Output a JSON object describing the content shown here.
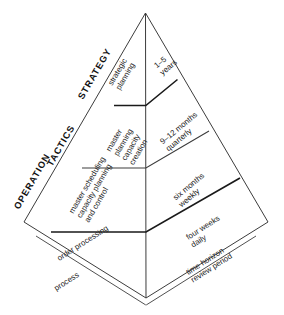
{
  "diagram": {
    "line_color": "#3c3c3c",
    "bold_line_color": "#1a1a1a",
    "background": "#ffffff",
    "edge_labels": [
      {
        "key": "operation",
        "text": "OPERATION"
      },
      {
        "key": "tactics",
        "text": "TACTICS"
      },
      {
        "key": "strategy",
        "text": "STRATEGY"
      }
    ],
    "axis_labels": [
      {
        "key": "process",
        "text": "process"
      },
      {
        "key": "time-horizon",
        "text": "time horizon\nreview period"
      }
    ],
    "tiers": [
      {
        "key": "tier-strategic",
        "level": "STRATEGY",
        "process": "strategic\nplanning",
        "horizon": "1–5\nyears"
      },
      {
        "key": "tier-master-planning",
        "level": "TACTICS",
        "process": "master\nplanning\ncapacity\ncreation",
        "horizon": "9–12 months\nquarterly"
      },
      {
        "key": "tier-master-scheduling",
        "level": "TACTICS",
        "process": "master scheduling\ncapacity planning\nand control",
        "horizon": "six months\nweekly"
      },
      {
        "key": "tier-order-processing",
        "level": "OPERATION",
        "process": "order processing",
        "horizon": "four weeks\ndaily"
      }
    ]
  }
}
